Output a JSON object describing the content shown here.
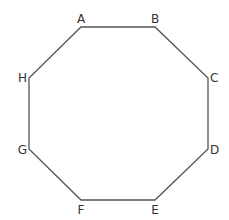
{
  "diagram": {
    "shape": "octagon",
    "stroke_color": "#555555",
    "vertices": [
      {
        "label": "A",
        "x": 81,
        "y": 27,
        "lx": 81,
        "ly": 23
      },
      {
        "label": "B",
        "x": 155,
        "y": 27,
        "lx": 155,
        "ly": 23
      },
      {
        "label": "C",
        "x": 208,
        "y": 78,
        "lx": 212,
        "ly": 82
      },
      {
        "label": "D",
        "x": 208,
        "y": 149,
        "lx": 212,
        "ly": 154
      },
      {
        "label": "E",
        "x": 155,
        "y": 200,
        "lx": 155,
        "ly": 213
      },
      {
        "label": "F",
        "x": 81,
        "y": 200,
        "lx": 81,
        "ly": 213
      },
      {
        "label": "G",
        "x": 29,
        "y": 149,
        "lx": 26,
        "ly": 154
      },
      {
        "label": "H",
        "x": 29,
        "y": 78,
        "lx": 26,
        "ly": 82
      }
    ]
  }
}
